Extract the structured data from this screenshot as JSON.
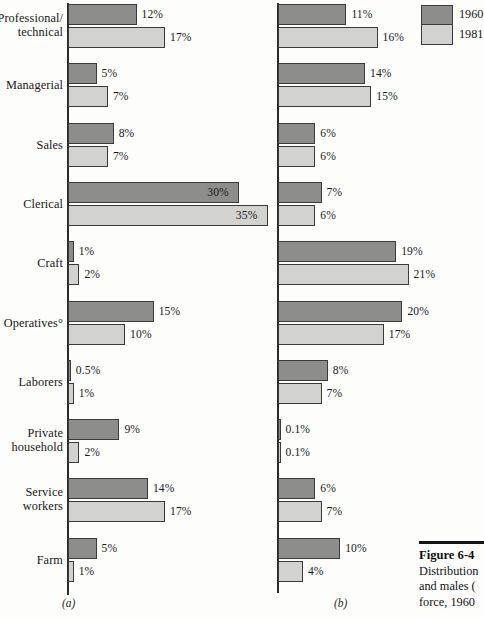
{
  "chart_data": {
    "type": "bar",
    "orientation": "horizontal",
    "title": "",
    "xlabel": "",
    "ylabel": "",
    "grid": false,
    "legend_position": "top-right",
    "categories": [
      "Professional/\ntechnical",
      "Managerial",
      "Sales",
      "Clerical",
      "Craft",
      "Operatives°",
      "Laborers",
      "Private\nhousehold",
      "Service\nworkers",
      "Farm"
    ],
    "panels": [
      {
        "letter": "(a)",
        "xlim": [
          0,
          35
        ],
        "series": [
          {
            "name": "1960",
            "values": [
              12,
              5,
              8,
              30,
              1,
              15,
              0.5,
              9,
              14,
              5
            ],
            "labels": [
              "12%",
              "5%",
              "8%",
              "30%",
              "1%",
              "15%",
              "0.5%",
              "9%",
              "14%",
              "5%"
            ]
          },
          {
            "name": "1981",
            "values": [
              17,
              7,
              7,
              35,
              2,
              10,
              1,
              2,
              17,
              1
            ],
            "labels": [
              "17%",
              "7%",
              "7%",
              "35%",
              "2%",
              "10%",
              "1%",
              "2%",
              "17%",
              "1%"
            ]
          }
        ]
      },
      {
        "letter": "(b)",
        "xlim": [
          0,
          21
        ],
        "series": [
          {
            "name": "1960",
            "values": [
              11,
              14,
              6,
              7,
              19,
              20,
              8,
              0.1,
              6,
              10
            ],
            "labels": [
              "11%",
              "14%",
              "6%",
              "7%",
              "19%",
              "20%",
              "8%",
              "0.1%",
              "6%",
              "10%"
            ]
          },
          {
            "name": "1981",
            "values": [
              16,
              15,
              6,
              6,
              21,
              17,
              7,
              0.1,
              7,
              4
            ],
            "labels": [
              "16%",
              "15%",
              "6%",
              "6%",
              "21%",
              "17%",
              "7%",
              "0.1%",
              "7%",
              "4%"
            ]
          }
        ]
      }
    ]
  },
  "legend": {
    "items": [
      {
        "label": "1960",
        "color": "#8d8d8c"
      },
      {
        "label": "1981",
        "color": "#d2d2cf"
      }
    ]
  },
  "caption": {
    "title": "Figure 6-4",
    "lines": [
      "Distribution",
      "and males (",
      "force, 1960"
    ]
  },
  "colors": {
    "bar_1960": "#8d8d8c",
    "bar_1981": "#d2d2cf",
    "bar_outline": "#3a3a38",
    "axis": "#2a2a28",
    "text": "#17171a",
    "background": "#fdfdfc"
  }
}
